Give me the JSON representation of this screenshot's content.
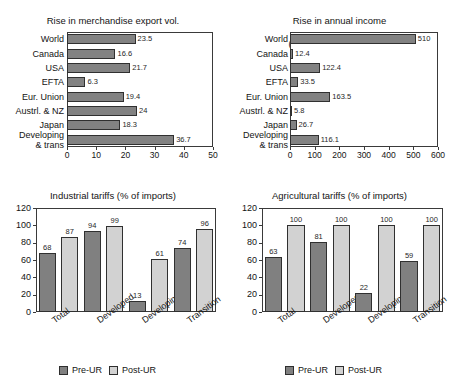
{
  "figure": {
    "legend": {
      "pre_label": "Pre-UR",
      "post_label": "Post-UR",
      "pre_color": "#808080",
      "post_color": "#d2d2d2"
    }
  },
  "chart_data": [
    {
      "id": "merchandise-export",
      "type": "bar",
      "orientation": "horizontal",
      "title": "Rise in merchandise export vol.\n(%) in 2005",
      "title_line1": "Rise in merchandise export vol.",
      "title_line2": "(%) in 2005",
      "xlabel": "",
      "ylabel": "",
      "xlim": [
        0,
        50
      ],
      "xticks": [
        0,
        10,
        20,
        30,
        40,
        50
      ],
      "grid": false,
      "bar_color": "#828282",
      "categories": [
        "World",
        "Canada",
        "USA",
        "EFTA",
        "Eur. Union",
        "Austrl. & NZ",
        "Japan",
        "Developing\n& trans"
      ],
      "values": [
        23.5,
        16.6,
        21.7,
        6.3,
        19.4,
        24,
        18.3,
        36.7
      ],
      "labels": [
        "23.5",
        "16.6",
        "21.7",
        "6.3",
        "19.4",
        "24",
        "18.3",
        "36.7"
      ]
    },
    {
      "id": "annual-income",
      "type": "bar",
      "orientation": "horizontal",
      "title": "Rise in annual income\n(1990 US$ billion), 2005",
      "title_line1": "Rise in annual income",
      "title_line2": "(1990 US$ billion), 2005",
      "xlabel": "",
      "ylabel": "",
      "xlim": [
        0,
        600
      ],
      "xticks": [
        0,
        100,
        200,
        300,
        400,
        500,
        600
      ],
      "grid": false,
      "bar_color": "#828282",
      "categories": [
        "World",
        "Canada",
        "USA",
        "EFTA",
        "Eur. Union",
        "Austrl. & NZ",
        "Japan",
        "Developing\n& trans"
      ],
      "values": [
        510,
        12.4,
        122.4,
        33.5,
        163.5,
        5.8,
        26.7,
        116.1
      ],
      "labels": [
        "510",
        "12.4",
        "122.4",
        "33.5",
        "163.5",
        "5.8",
        "26.7",
        "116.1"
      ]
    },
    {
      "id": "industrial-tariffs",
      "type": "bar",
      "orientation": "vertical",
      "title": "Industrial tariffs (% of imports)",
      "xlabel": "",
      "ylabel": "",
      "ylim": [
        0,
        120
      ],
      "yticks": [
        0,
        20,
        40,
        60,
        80,
        100,
        120
      ],
      "grid": false,
      "categories": [
        "Total",
        "Developed",
        "Developing",
        "Transition"
      ],
      "series": [
        {
          "name": "Pre-UR",
          "color": "#808080",
          "values": [
            68,
            94,
            13,
            74
          ]
        },
        {
          "name": "Post-UR",
          "color": "#d2d2d2",
          "values": [
            87,
            99,
            61,
            96
          ]
        }
      ]
    },
    {
      "id": "agricultural-tariffs",
      "type": "bar",
      "orientation": "vertical",
      "title": "Agricultural tariffs (% of imports)",
      "xlabel": "",
      "ylabel": "",
      "ylim": [
        0,
        120
      ],
      "yticks": [
        0,
        20,
        40,
        60,
        80,
        100,
        120
      ],
      "grid": false,
      "categories": [
        "Total",
        "Developed",
        "Developing",
        "Transition"
      ],
      "series": [
        {
          "name": "Pre-UR",
          "color": "#808080",
          "values": [
            63,
            81,
            22,
            59
          ]
        },
        {
          "name": "Post-UR",
          "color": "#d2d2d2",
          "values": [
            100,
            100,
            100,
            100
          ]
        }
      ]
    }
  ]
}
